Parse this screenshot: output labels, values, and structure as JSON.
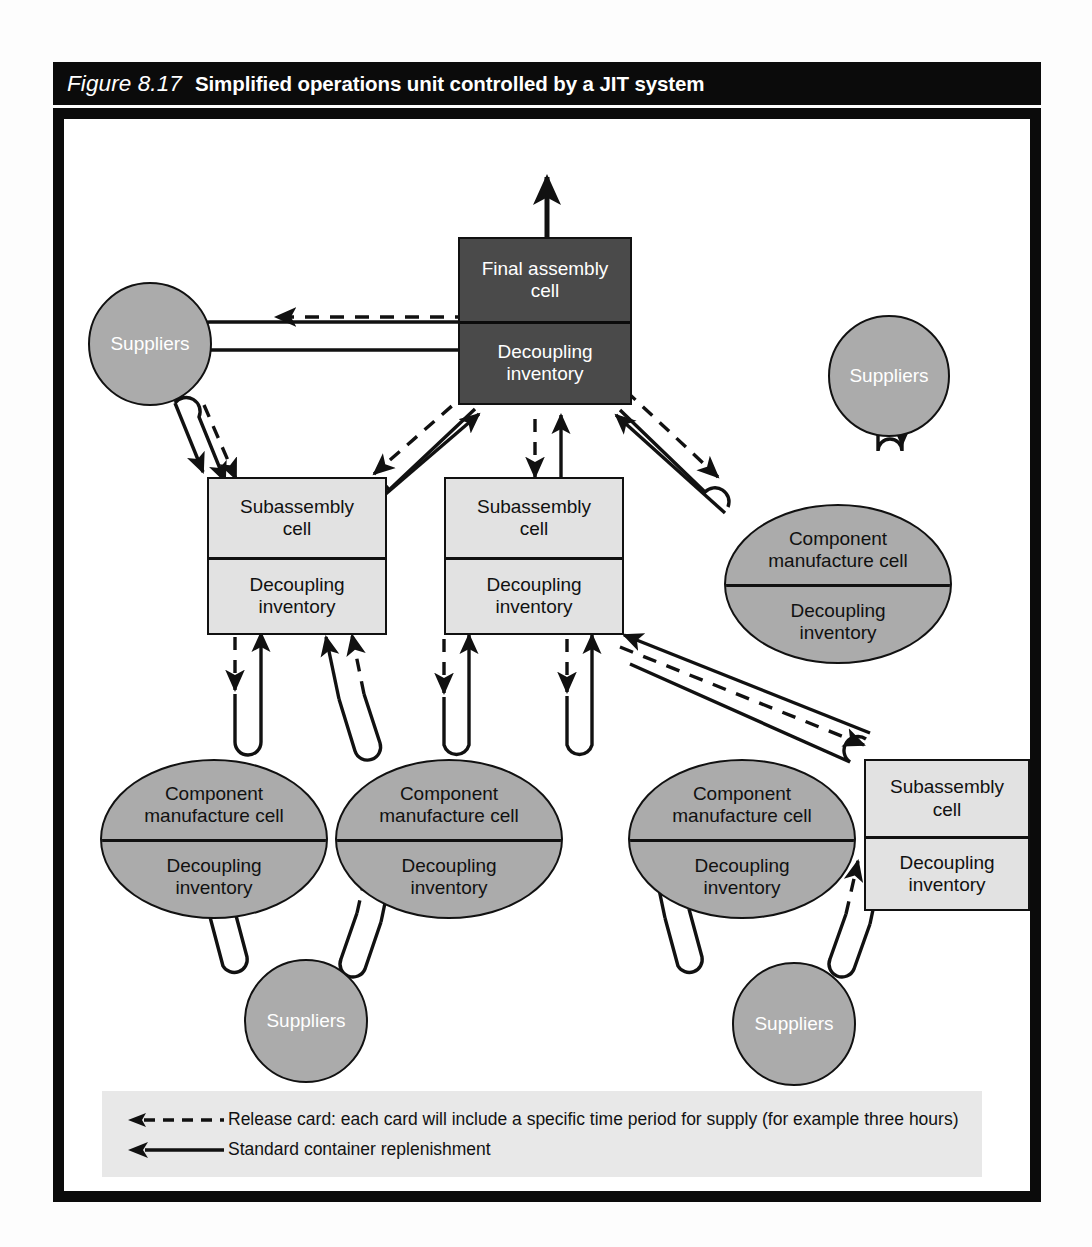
{
  "figure": {
    "number": "Figure 8.17",
    "title": "Simplified operations unit controlled by a JIT system"
  },
  "labels": {
    "final_assembly": "Final assembly",
    "cell_word": "cell",
    "decoupling": "Decoupling",
    "inventory": "inventory",
    "subassembly": "Subassembly",
    "component": "Component",
    "manufacture_cell": "manufacture cell",
    "suppliers": "Suppliers"
  },
  "nodes": [
    {
      "id": "final-assembly-cell",
      "type": "rect-dark",
      "top_line1": "Final assembly",
      "top_line2": "cell",
      "bottom_line1": "Decoupling",
      "bottom_line2": "inventory"
    },
    {
      "id": "subassembly-cell-left",
      "type": "rect-light",
      "top_line1": "Subassembly",
      "top_line2": "cell",
      "bottom_line1": "Decoupling",
      "bottom_line2": "inventory"
    },
    {
      "id": "subassembly-cell-center",
      "type": "rect-light",
      "top_line1": "Subassembly",
      "top_line2": "cell",
      "bottom_line1": "Decoupling",
      "bottom_line2": "inventory"
    },
    {
      "id": "subassembly-cell-right",
      "type": "rect-light",
      "top_line1": "Subassembly",
      "top_line2": "cell",
      "bottom_line1": "Decoupling",
      "bottom_line2": "inventory"
    },
    {
      "id": "component-cell-upper-right",
      "type": "ellipse",
      "top_line1": "Component",
      "top_line2": "manufacture cell",
      "bottom_line1": "Decoupling",
      "bottom_line2": "inventory"
    },
    {
      "id": "component-cell-bottom-1",
      "type": "ellipse",
      "top_line1": "Component",
      "top_line2": "manufacture cell",
      "bottom_line1": "Decoupling",
      "bottom_line2": "inventory"
    },
    {
      "id": "component-cell-bottom-2",
      "type": "ellipse",
      "top_line1": "Component",
      "top_line2": "manufacture cell",
      "bottom_line1": "Decoupling",
      "bottom_line2": "inventory"
    },
    {
      "id": "component-cell-bottom-3",
      "type": "ellipse",
      "top_line1": "Component",
      "top_line2": "manufacture cell",
      "bottom_line1": "Decoupling",
      "bottom_line2": "inventory"
    },
    {
      "id": "suppliers-top-left",
      "type": "circle",
      "label": "Suppliers"
    },
    {
      "id": "suppliers-right",
      "type": "circle",
      "label": "Suppliers"
    },
    {
      "id": "suppliers-bottom-left",
      "type": "circle",
      "label": "Suppliers"
    },
    {
      "id": "suppliers-bottom-right",
      "type": "circle",
      "label": "Suppliers"
    }
  ],
  "legend": {
    "items": [
      {
        "icon": "dashed-arrow-left-icon",
        "text": "Release card: each card will include a specific time period for supply (for example three hours)"
      },
      {
        "icon": "solid-arrow-left-icon",
        "text": "Standard container replenishment"
      }
    ]
  },
  "colors": {
    "frame": "#0b0b0b",
    "dark_cell": "#4a4a4a",
    "light_cell": "#e2e2e2",
    "gray_shape": "#ababab",
    "legend_bg": "#e8e8e8",
    "line": "#111111"
  }
}
